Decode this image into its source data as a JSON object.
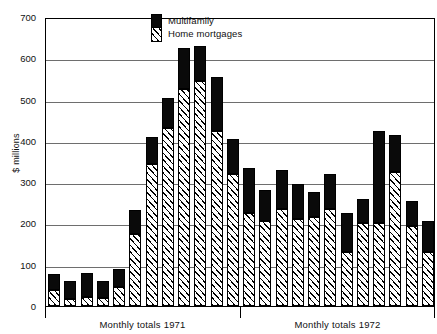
{
  "chart_data": {
    "type": "bar",
    "title": "",
    "subtitle": "",
    "xlabel": "",
    "ylabel": "$ millions",
    "ylim": [
      0,
      700
    ],
    "ytick_values": [
      0,
      100,
      200,
      300,
      400,
      500,
      600,
      700
    ],
    "ytick_labels": [
      "0",
      "100",
      "200",
      "300",
      "400",
      "500",
      "600",
      "700"
    ],
    "grid": true,
    "stacked": true,
    "legend_position": "top-center",
    "legend": [
      "Multifamily",
      "Home mortgages"
    ],
    "series": [
      {
        "name": "Home mortgages",
        "color": "#ffffff",
        "pattern": "diagonal-hatch",
        "values": [
          40,
          18,
          22,
          20,
          45,
          175,
          345,
          430,
          525,
          545,
          425,
          320,
          225,
          205,
          235,
          210,
          215,
          235,
          130,
          200,
          200,
          325,
          195,
          130
        ]
      },
      {
        "name": "Multifamily",
        "color": "#0a0a0a",
        "pattern": "solid",
        "values": [
          38,
          42,
          58,
          40,
          45,
          58,
          65,
          75,
          100,
          85,
          130,
          85,
          110,
          75,
          95,
          85,
          60,
          85,
          95,
          60,
          225,
          90,
          60,
          75
        ]
      }
    ],
    "totals": [
      78,
      60,
      80,
      60,
      90,
      233,
      410,
      505,
      625,
      630,
      555,
      405,
      335,
      280,
      330,
      295,
      275,
      320,
      225,
      260,
      425,
      415,
      255,
      205
    ],
    "categories": [
      "1971-01",
      "1971-02",
      "1971-03",
      "1971-04",
      "1971-05",
      "1971-06",
      "1971-07",
      "1971-08",
      "1971-09",
      "1971-10",
      "1971-11",
      "1971-12",
      "1972-01",
      "1972-02",
      "1972-03",
      "1972-04",
      "1972-05",
      "1972-06",
      "1972-07",
      "1972-08",
      "1972-09",
      "1972-10",
      "1972-11",
      "1972-12"
    ],
    "groups": [
      {
        "label": "Monthly totals 1971",
        "start": 0,
        "end": 11
      },
      {
        "label": "Monthly totals 1972",
        "start": 12,
        "end": 23
      }
    ]
  }
}
